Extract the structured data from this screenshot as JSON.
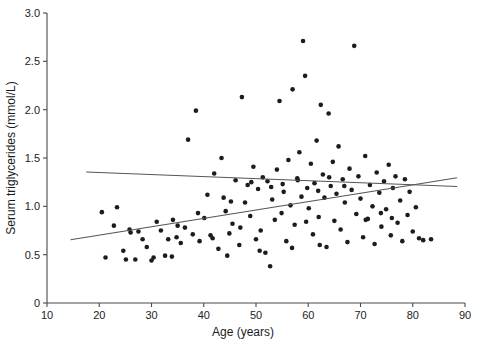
{
  "chart_data": {
    "type": "scatter",
    "title": "",
    "xlabel": "Age (years)",
    "ylabel": "Serum triglycerides  (mmol/L)",
    "xlim": [
      10,
      90
    ],
    "ylim": [
      0,
      3.0
    ],
    "xticks": [
      10,
      20,
      30,
      40,
      50,
      60,
      70,
      80,
      90
    ],
    "xtick_labels": [
      "10",
      "20",
      "30",
      "40",
      "50",
      "60",
      "70",
      "80",
      "90"
    ],
    "yticks": [
      0,
      0.5,
      1.0,
      1.5,
      2.0,
      2.5,
      3.0
    ],
    "ytick_labels": [
      "0",
      "0.5",
      "1.0",
      "1.5",
      "2.0",
      "2.5",
      "3.0"
    ],
    "grid": false,
    "legend": "none",
    "marker": "filled-circle",
    "marker_color": "#1c1c1c",
    "marker_size_px": 4.6,
    "points": [
      [
        20.5,
        0.94
      ],
      [
        21.2,
        0.47
      ],
      [
        22.8,
        0.8
      ],
      [
        23.4,
        0.99
      ],
      [
        24.6,
        0.54
      ],
      [
        25.1,
        0.45
      ],
      [
        25.8,
        0.76
      ],
      [
        26.0,
        0.73
      ],
      [
        26.9,
        0.45
      ],
      [
        28.3,
        0.66
      ],
      [
        29.1,
        0.58
      ],
      [
        30.4,
        0.47
      ],
      [
        31.0,
        0.84
      ],
      [
        31.8,
        0.75
      ],
      [
        32.6,
        0.49
      ],
      [
        33.2,
        0.66
      ],
      [
        34.1,
        0.86
      ],
      [
        34.8,
        0.68
      ],
      [
        35.6,
        0.62
      ],
      [
        36.4,
        0.78
      ],
      [
        37.0,
        1.69
      ],
      [
        37.9,
        0.71
      ],
      [
        38.5,
        1.99
      ],
      [
        39.2,
        0.64
      ],
      [
        40.1,
        0.88
      ],
      [
        40.7,
        1.12
      ],
      [
        41.3,
        0.7
      ],
      [
        42.0,
        1.34
      ],
      [
        42.8,
        0.56
      ],
      [
        43.4,
        1.5
      ],
      [
        44.2,
        0.95
      ],
      [
        44.9,
        0.72
      ],
      [
        45.5,
        0.82
      ],
      [
        46.1,
        1.27
      ],
      [
        46.8,
        0.6
      ],
      [
        47.3,
        2.13
      ],
      [
        47.9,
        1.04
      ],
      [
        48.4,
        1.22
      ],
      [
        48.9,
        0.9
      ],
      [
        49.5,
        1.41
      ],
      [
        50.0,
        0.66
      ],
      [
        50.4,
        1.18
      ],
      [
        50.9,
        0.75
      ],
      [
        51.3,
        1.3
      ],
      [
        51.8,
        0.52
      ],
      [
        52.2,
        1.26
      ],
      [
        52.7,
        0.38
      ],
      [
        53.1,
        1.07
      ],
      [
        53.6,
        0.86
      ],
      [
        54.0,
        1.38
      ],
      [
        54.5,
        2.09
      ],
      [
        54.9,
        0.93
      ],
      [
        55.3,
        1.15
      ],
      [
        55.8,
        0.64
      ],
      [
        56.2,
        1.48
      ],
      [
        56.6,
        1.01
      ],
      [
        57.0,
        2.21
      ],
      [
        57.4,
        0.81
      ],
      [
        57.9,
        1.29
      ],
      [
        58.3,
        1.56
      ],
      [
        58.7,
        1.1
      ],
      [
        59.0,
        2.71
      ],
      [
        59.4,
        2.35
      ],
      [
        59.8,
        1.19
      ],
      [
        60.1,
        0.98
      ],
      [
        60.5,
        1.44
      ],
      [
        60.9,
        0.71
      ],
      [
        61.2,
        1.24
      ],
      [
        61.6,
        1.68
      ],
      [
        62.0,
        0.89
      ],
      [
        62.4,
        2.05
      ],
      [
        62.8,
        1.33
      ],
      [
        63.1,
        1.09
      ],
      [
        63.5,
        0.58
      ],
      [
        63.9,
        1.96
      ],
      [
        64.3,
        1.21
      ],
      [
        64.7,
        1.46
      ],
      [
        65.0,
        0.85
      ],
      [
        65.4,
        1.13
      ],
      [
        65.8,
        1.62
      ],
      [
        66.2,
        0.76
      ],
      [
        66.6,
        1.28
      ],
      [
        67.0,
        1.04
      ],
      [
        67.5,
        0.63
      ],
      [
        67.9,
        1.39
      ],
      [
        68.3,
        1.17
      ],
      [
        68.8,
        2.66
      ],
      [
        69.2,
        0.92
      ],
      [
        69.6,
        1.31
      ],
      [
        70.0,
        1.08
      ],
      [
        70.5,
        0.68
      ],
      [
        70.9,
        1.52
      ],
      [
        71.4,
        0.87
      ],
      [
        71.8,
        1.22
      ],
      [
        72.3,
        1.0
      ],
      [
        72.7,
        0.61
      ],
      [
        73.1,
        1.35
      ],
      [
        73.6,
        1.14
      ],
      [
        74.0,
        0.79
      ],
      [
        74.5,
        1.26
      ],
      [
        74.9,
        0.97
      ],
      [
        75.4,
        1.43
      ],
      [
        75.8,
        0.7
      ],
      [
        76.2,
        1.19
      ],
      [
        76.7,
        1.31
      ],
      [
        77.1,
        0.83
      ],
      [
        77.6,
        1.06
      ],
      [
        78.0,
        0.64
      ],
      [
        78.5,
        1.28
      ],
      [
        79.0,
        0.91
      ],
      [
        79.4,
        1.15
      ],
      [
        80.0,
        0.74
      ],
      [
        80.6,
        0.99
      ],
      [
        81.2,
        0.67
      ],
      [
        82.0,
        0.65
      ],
      [
        83.5,
        0.66
      ],
      [
        43.8,
        1.09
      ],
      [
        45.2,
        1.05
      ],
      [
        49.1,
        1.25
      ],
      [
        52.9,
        1.2
      ],
      [
        55.1,
        1.23
      ],
      [
        58.0,
        1.27
      ],
      [
        61.9,
        1.16
      ],
      [
        64.0,
        1.3
      ],
      [
        66.9,
        1.21
      ],
      [
        38.9,
        0.93
      ],
      [
        41.7,
        0.67
      ],
      [
        35.0,
        0.8
      ],
      [
        27.5,
        0.74
      ],
      [
        30.0,
        0.44
      ],
      [
        33.9,
        0.48
      ],
      [
        47.0,
        0.78
      ],
      [
        50.7,
        0.54
      ],
      [
        56.9,
        0.57
      ],
      [
        59.6,
        0.84
      ],
      [
        62.2,
        0.6
      ],
      [
        71.0,
        0.86
      ],
      [
        73.9,
        0.93
      ],
      [
        76.0,
        0.88
      ],
      [
        44.5,
        0.49
      ]
    ],
    "lines": [
      {
        "name": "flat-fit-line",
        "x_start": 17.5,
        "y_start": 1.355,
        "x_end": 88.5,
        "y_end": 1.205
      },
      {
        "name": "rising-fit-line",
        "x_start": 14.5,
        "y_start": 0.655,
        "x_end": 88.5,
        "y_end": 1.295
      }
    ]
  }
}
